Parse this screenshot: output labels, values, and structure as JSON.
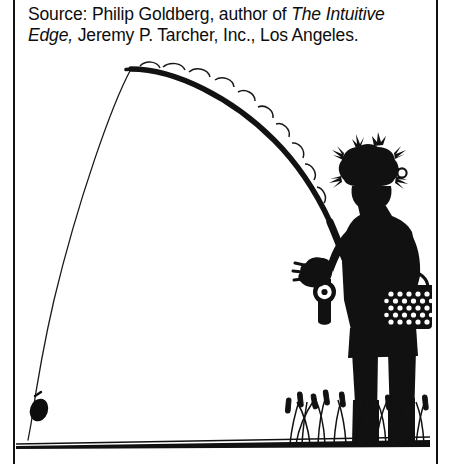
{
  "figure": {
    "width": 450,
    "height": 464,
    "background_color": "#ffffff",
    "ink_color": "#111111"
  },
  "caption": {
    "prefix": "Source: Philip Goldberg, author of ",
    "book_title": "The Intuitive Edge,",
    "suffix": " Jeremy P. Tarcher, Inc., Los Angeles.",
    "full_text": "Source: Philip Goldberg, author of The Intuitive Edge, Jeremy P. Tarcher, Inc., Los Angeles."
  },
  "illustration": {
    "description": "Silhouette line drawing of a fisherman standing in reeds holding a deeply bent fishing rod, with the line arcing down to a sinker resting on the ground at left.",
    "elements": [
      {
        "name": "fishing-rod",
        "label": "Bent fishing rod with line guides"
      },
      {
        "name": "fishing-line",
        "label": "Fishing line arcing from rod tip to sinker"
      },
      {
        "name": "sinker",
        "label": "Black sinker weight on line near ground"
      },
      {
        "name": "ground-line",
        "label": "Thick horizontal ground line"
      },
      {
        "name": "fisherman",
        "label": "Fisherman silhouette"
      },
      {
        "name": "fishing-hat",
        "label": "Hat covered in fishing lures and flies"
      },
      {
        "name": "fishing-reel",
        "label": "Reel mounted on rod handle"
      },
      {
        "name": "creel-basket",
        "label": "Woven creel basket hanging at the hip"
      },
      {
        "name": "cattails",
        "label": "Cattails and marsh grass along the ground"
      }
    ]
  }
}
